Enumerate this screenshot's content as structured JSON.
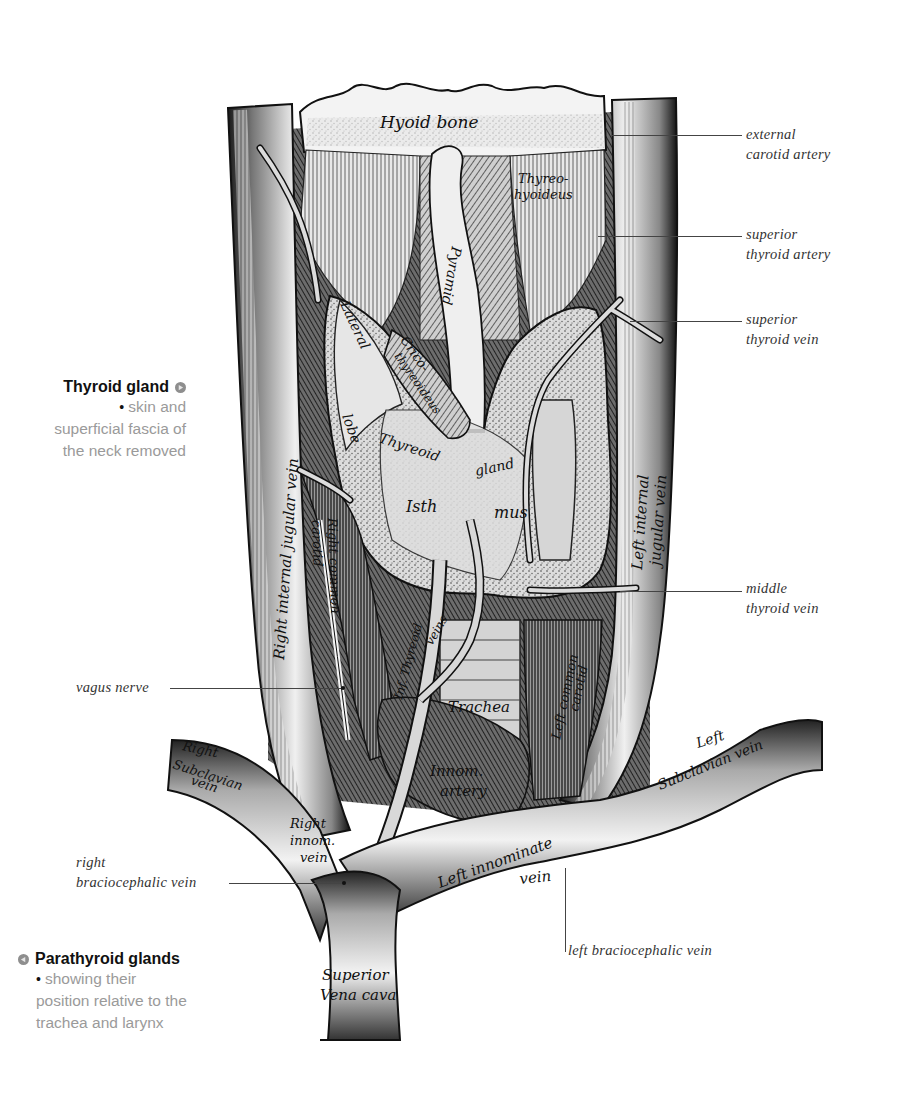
{
  "figure": {
    "accent_gray": "#9a9a9a",
    "text_black": "#111111"
  },
  "captions": {
    "thyroid": {
      "title": "Thyroid gland",
      "marker_icon": "right-arrow-circle-icon",
      "bullet": "•",
      "line1": "skin and",
      "line2": "superficial fascia of",
      "line3": "the neck removed"
    },
    "parathyroid": {
      "title": "Parathyroid glands",
      "marker_icon": "left-arrow-circle-icon",
      "bullet": "•",
      "line1": "showing their",
      "line2": "position relative to the",
      "line3": "trachea and larynx"
    }
  },
  "callouts": {
    "external_carotid": {
      "line1": "external",
      "line2": "carotid artery"
    },
    "superior_thyroid_artery": {
      "line1": "superior",
      "line2": "thyroid artery"
    },
    "superior_thyroid_vein": {
      "line1": "superior",
      "line2": "thyroid vein"
    },
    "middle_thyroid_vein": {
      "line1": "middle",
      "line2": "thyroid vein"
    },
    "vagus_nerve": {
      "line1": "vagus nerve"
    },
    "right_braciocephalic": {
      "line1": "right",
      "line2": "braciocephalic vein"
    },
    "left_braciocephalic": {
      "line1": "left braciocephalic vein"
    }
  },
  "engraved_labels": {
    "hyoid_bone": "Hyoid bone",
    "thyreo_hyoideus_1": "Thyreo-",
    "thyreo_hyoideus_2": "hyoideus",
    "pyramid": "Pyramid",
    "lateral": "Lateral",
    "lobe": "lobe",
    "crico_1": "Crico-",
    "crico_2": "thyreoideus",
    "thyreoid": "Thyreoid",
    "gland": "gland",
    "isthmus_1": "Isth",
    "isthmus_2": "mus",
    "right_internal_jugular": "Right internal jugular vein",
    "left_internal_jugular_1": "Left internal",
    "left_internal_jugular_2": "jugular vein",
    "right_common_carotid_1": "Right common",
    "right_common_carotid_2": "carotid",
    "inf_thyreoid_veins_1": "Inf. Thyreoid",
    "inf_thyreoid_veins_2": "veins",
    "trachea": "Trachea",
    "left_common_carotid_1": "Left common",
    "left_common_carotid_2": "carotid",
    "innom_artery_1": "Innom.",
    "innom_artery_2": "artery",
    "right_subclavian_1": "Right",
    "right_subclavian_2": "Subclavian",
    "right_subclavian_3": "vein",
    "left_subclavian_1": "Left",
    "left_subclavian_2": "Subclavian vein",
    "right_innom_1": "Right",
    "right_innom_2": "innom.",
    "right_innom_3": "vein",
    "left_innominate_1": "Left innominate",
    "left_innominate_2": "vein",
    "svc_1": "Superior",
    "svc_2": "Vena cava"
  }
}
